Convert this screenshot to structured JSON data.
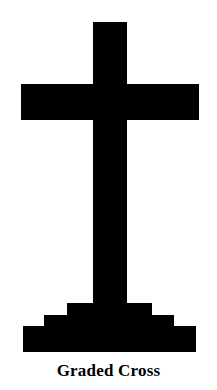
{
  "figure": {
    "name": "graded-cross",
    "caption": "Graded Cross",
    "canvas": {
      "width": 217,
      "height": 390
    },
    "colors": {
      "background": "#ffffff",
      "figure": "#000000",
      "caption_text": "#000000"
    },
    "shape": {
      "description": "A Latin cross standing on a three-tiered stepped base, rendered as a solid black silhouette on white.",
      "parts": [
        {
          "name": "vertical-beam",
          "label": "Upright",
          "x": 93,
          "y": 22,
          "width": 34,
          "height": 281
        },
        {
          "name": "horizontal-crossbar",
          "label": "Crossbar",
          "x": 21,
          "y": 84,
          "width": 178,
          "height": 36
        },
        {
          "name": "step-top",
          "label": "Top step",
          "x": 67,
          "y": 303,
          "width": 85,
          "height": 12
        },
        {
          "name": "step-middle",
          "label": "Middle step",
          "x": 44,
          "y": 315,
          "width": 130,
          "height": 11
        },
        {
          "name": "step-bottom",
          "label": "Bottom step",
          "x": 23,
          "y": 326,
          "width": 173,
          "height": 26
        }
      ],
      "outline_path": "M 93 22 L 127 22 L 127 84 L 199 84 L 199 120 L 127 120 L 127 303 L 152 303 L 152 315 L 174 315 L 174 326 L 196 326 L 196 352 L 23 352 L 23 326 L 44 326 L 44 315 L 67 315 L 67 303 L 93 303 L 93 120 L 21 120 L 21 84 L 93 84 Z"
    }
  }
}
